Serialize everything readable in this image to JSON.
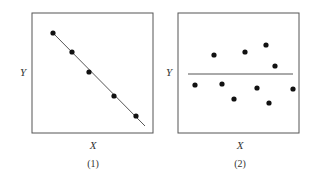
{
  "chart_data": [
    {
      "type": "scatter",
      "panel_label": "(1)",
      "xlabel": "X",
      "ylabel": "Y",
      "grid": false,
      "points_px": [
        [
          53,
          33
        ],
        [
          72,
          52
        ],
        [
          89,
          72
        ],
        [
          114,
          96
        ],
        [
          136,
          116
        ]
      ],
      "fit_line_px": [
        [
          53,
          33
        ],
        [
          145,
          126
        ]
      ],
      "description": "Strong negative linear relationship; points lie on a descending fitted line"
    },
    {
      "type": "scatter",
      "panel_label": "(2)",
      "xlabel": "X",
      "ylabel": "Y",
      "grid": false,
      "points_px": [
        [
          195,
          85
        ],
        [
          214,
          55
        ],
        [
          222,
          84
        ],
        [
          234,
          99
        ],
        [
          245,
          52
        ],
        [
          257,
          88
        ],
        [
          266,
          45
        ],
        [
          269,
          103
        ],
        [
          275,
          66
        ],
        [
          293,
          89
        ]
      ],
      "fit_line_px": [
        [
          188,
          74
        ],
        [
          293,
          74
        ]
      ],
      "description": "No relationship; points scattered around a horizontal line"
    }
  ],
  "panels": [
    {
      "ylabel": "Y",
      "xlabel": "X",
      "caption": "(1)"
    },
    {
      "ylabel": "Y",
      "xlabel": "X",
      "caption": "(2)"
    }
  ]
}
